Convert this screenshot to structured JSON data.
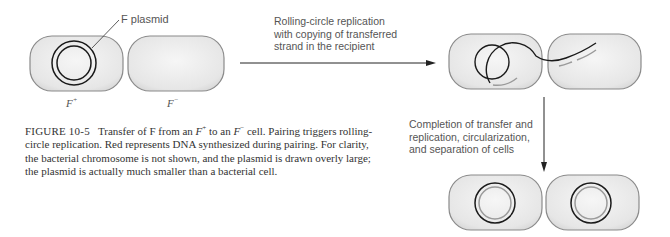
{
  "figure": {
    "number_label": "FIGURE 10-5",
    "caption_parts": [
      "Transfer of F from an ",
      "F",
      "+",
      " to an ",
      "F",
      "−",
      " cell. Pairing triggers rolling-circle replication. Red represents DNA synthesized during pairing. For clarity, the bacterial chromosome is not shown, and the plasmid is drawn overly large; the plasmid is actually much smaller than a bacterial cell."
    ]
  },
  "labels": {
    "plasmid": "F plasmid",
    "donor_cell": "F",
    "donor_sup": "+",
    "recipient_cell": "F",
    "recipient_sup": "−"
  },
  "steps": [
    {
      "text_lines": [
        "Rolling-circle replication",
        "with copying of transferred",
        "strand in the recipient"
      ]
    },
    {
      "text_lines": [
        "Completion of transfer and",
        "replication, circularization,",
        "and separation of cells"
      ]
    }
  ],
  "colors": {
    "cell_fill": "#ececec",
    "cell_stroke": "#8a8a8a",
    "dna_strand": "#1a1a1a",
    "new_dna": "#9a9a9a",
    "arrow": "#222222"
  }
}
